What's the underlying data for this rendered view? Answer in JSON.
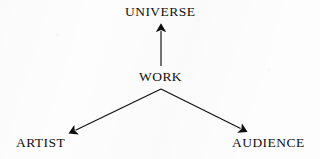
{
  "diagram": {
    "type": "node-arrow-diagram",
    "title": "",
    "background_color": "#fdfdfd",
    "ink_color": "#100f10",
    "nodes": [
      {
        "id": "universe",
        "label": "UNIVERSE",
        "x": 161,
        "y": 12
      },
      {
        "id": "work",
        "label": "WORK",
        "x": 161,
        "y": 77
      },
      {
        "id": "artist",
        "label": "ARTIST",
        "x": 41,
        "y": 143
      },
      {
        "id": "audience",
        "label": "AUDIENCE",
        "x": 268,
        "y": 143
      }
    ],
    "arrows": [
      {
        "id": "work-to-universe",
        "from": "work",
        "to": "universe",
        "x1": 161,
        "y1": 66,
        "x2": 161,
        "y2": 25,
        "arrowhead": "end",
        "direction": "up"
      },
      {
        "id": "work-to-artist",
        "from": "work",
        "to": "artist",
        "x1": 161,
        "y1": 89,
        "x2": 69,
        "y2": 133,
        "arrowhead": "end",
        "direction": "down-left"
      },
      {
        "id": "work-to-audience",
        "from": "work",
        "to": "audience",
        "x1": 161,
        "y1": 89,
        "x2": 247,
        "y2": 132,
        "arrowhead": "end",
        "direction": "down-right"
      }
    ]
  }
}
